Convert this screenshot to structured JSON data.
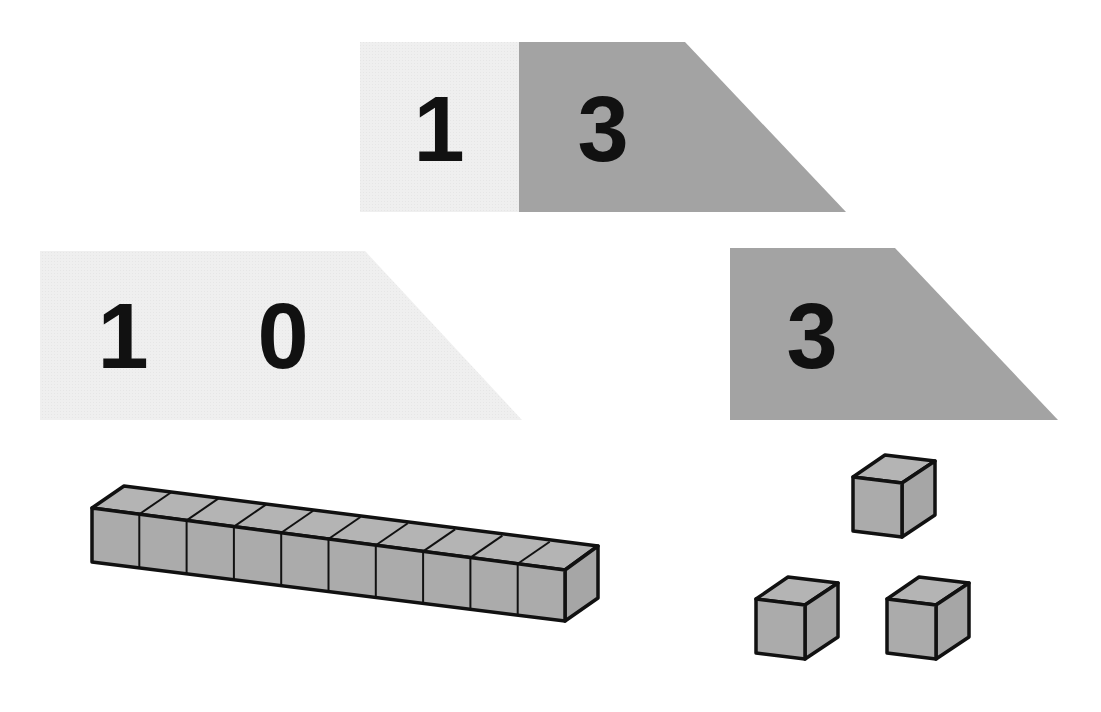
{
  "diagram": {
    "type": "place-value-arrow-cards",
    "colors": {
      "tens_card": "#efefef",
      "ones_card": "#a3a3a3",
      "block_fill": "#ababab",
      "block_stroke": "#111111",
      "digit": "#111111",
      "background": "#ffffff"
    },
    "combined_card": {
      "value": 13,
      "tens_digit": "1",
      "ones_digit": "3"
    },
    "tens_card": {
      "value": 10,
      "digits": [
        "1",
        "0"
      ]
    },
    "ones_card": {
      "value": 3,
      "digits": [
        "3"
      ]
    },
    "base_ten_blocks": {
      "rods": 1,
      "units_per_rod": 10,
      "loose_units": 3
    }
  }
}
